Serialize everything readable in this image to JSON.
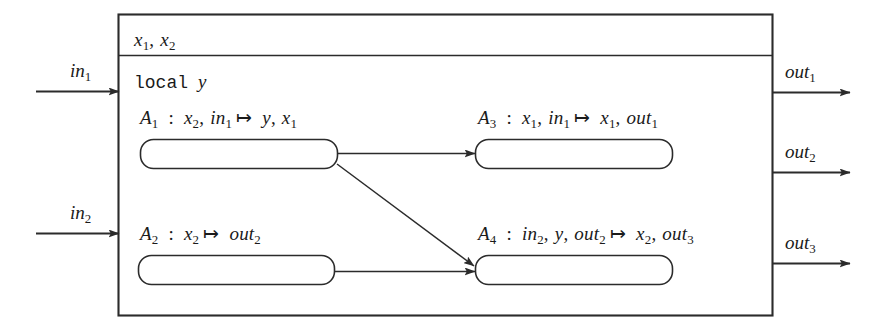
{
  "figure": {
    "kind": "component-block-diagram",
    "line_color": "#2b2b2b",
    "fill_color": "#ffffff"
  },
  "outer_block": {
    "name": "component-outer-block",
    "state_header": {
      "label": "x1, x2",
      "vars": [
        "x",
        "x"
      ],
      "subs": [
        "1",
        "2"
      ]
    },
    "local_decl": {
      "keyword": "local",
      "variable": "y"
    }
  },
  "inputs": [
    {
      "id": "in1",
      "base": "in",
      "sub": "1"
    },
    {
      "id": "in2",
      "base": "in",
      "sub": "2"
    }
  ],
  "outputs": [
    {
      "id": "out1",
      "base": "out",
      "sub": "1"
    },
    {
      "id": "out2",
      "base": "out",
      "sub": "2"
    },
    {
      "id": "out3",
      "base": "out",
      "sub": "3"
    }
  ],
  "actions": [
    {
      "id": "A1",
      "name": "A",
      "sub": "1",
      "reads": "x2, in1",
      "writes": "y, x1",
      "signature": "A1 : x2, in1 |-> y, x1"
    },
    {
      "id": "A3",
      "name": "A",
      "sub": "3",
      "reads": "x1, in1",
      "writes": "x1, out1",
      "signature": "A3 : x1, in1 |-> x1, out1"
    },
    {
      "id": "A2",
      "name": "A",
      "sub": "2",
      "reads": "x2",
      "writes": "out2",
      "signature": "A2 : x2 |-> out2"
    },
    {
      "id": "A4",
      "name": "A",
      "sub": "4",
      "reads": "in2, y, out2",
      "writes": "x2, out3",
      "signature": "A4 : in2, y, out2 |-> x2, out3"
    }
  ],
  "connections": [
    {
      "from": "A1",
      "to": "A3",
      "style": "horizontal-arrow"
    },
    {
      "from": "A1",
      "to": "A4",
      "style": "diagonal-arrow"
    },
    {
      "from": "A2",
      "to": "A4",
      "style": "horizontal-arrow"
    },
    {
      "from": "in1",
      "to": "outer_block",
      "style": "horizontal-arrow"
    },
    {
      "from": "in2",
      "to": "outer_block",
      "style": "horizontal-arrow"
    },
    {
      "from": "outer_block",
      "to": "out1",
      "style": "horizontal-arrow"
    },
    {
      "from": "outer_block",
      "to": "out2",
      "style": "horizontal-arrow"
    },
    {
      "from": "outer_block",
      "to": "out3",
      "style": "horizontal-arrow"
    }
  ]
}
